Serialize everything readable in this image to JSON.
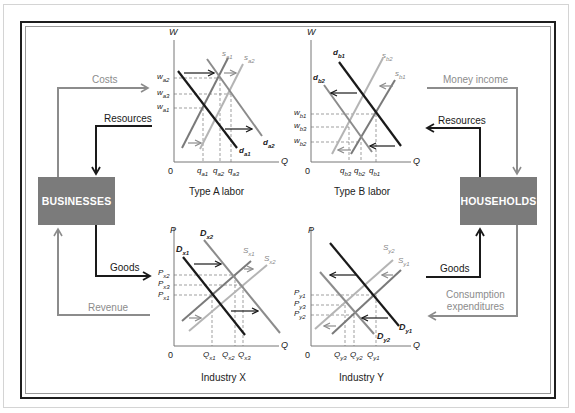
{
  "boxes": {
    "businesses": "BUSINESSES",
    "households": "HOUSEHOLDS"
  },
  "flows": {
    "costs": "Costs",
    "resources_left": "Resources",
    "goods_left": "Goods",
    "revenue": "Revenue",
    "money_income": "Money income",
    "resources_right": "Resources",
    "goods_right": "Goods",
    "consumption_line1": "Consumption",
    "consumption_line2": "expenditures"
  },
  "graphs": {
    "type_a": {
      "caption": "Type A labor",
      "y_axis": "W",
      "x_axis": "Q",
      "origin": "0",
      "y_ticks": [
        "w_a2",
        "w_a3",
        "w_a1"
      ],
      "x_ticks": [
        "q_a1",
        "q_a2",
        "q_a3"
      ],
      "curves": [
        "s_a1",
        "s_a2",
        "d_a1",
        "d_a2"
      ]
    },
    "type_b": {
      "caption": "Type B labor",
      "y_axis": "W",
      "x_axis": "Q",
      "origin": "0",
      "y_ticks": [
        "w_b1",
        "w_b3",
        "w_b2"
      ],
      "x_ticks": [
        "q_b3",
        "q_b2",
        "q_b1"
      ],
      "curves": [
        "s_b2",
        "s_b1",
        "d_b1",
        "d_b2"
      ]
    },
    "industry_x": {
      "caption": "Industry X",
      "y_axis": "P",
      "x_axis": "Q",
      "origin": "0",
      "y_ticks": [
        "P_x2",
        "P_x3",
        "P_x1"
      ],
      "x_ticks": [
        "Q_x1",
        "Q_x2",
        "Q_x3"
      ],
      "curves": [
        "S_x1",
        "S_x2",
        "D_x1",
        "D_x2"
      ]
    },
    "industry_y": {
      "caption": "Industry Y",
      "y_axis": "P",
      "x_axis": "Q",
      "origin": "0",
      "y_ticks": [
        "P_y1",
        "P_y3",
        "P_y2"
      ],
      "x_ticks": [
        "Q_y3",
        "Q_y2",
        "Q_y1"
      ],
      "curves": [
        "S_y2",
        "S_y1",
        "D_y1",
        "D_y2"
      ]
    }
  },
  "colors": {
    "box_fill": "#7b7b7b",
    "dark_line": "#1a1a1a",
    "gray_line": "#8c8c8c",
    "light_line": "#b4b4b4"
  }
}
